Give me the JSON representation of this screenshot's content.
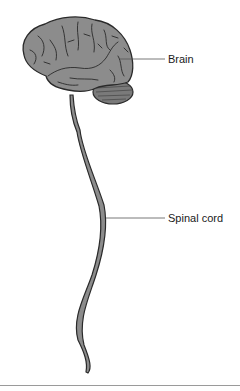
{
  "figure": {
    "type": "anatomical-diagram",
    "labels": [
      {
        "id": "brain",
        "text": "Brain",
        "line_y": 59,
        "line_x1": 120,
        "line_x2": 165
      },
      {
        "id": "spinal_cord",
        "text": "Spinal cord",
        "line_y": 218,
        "line_x1": 106,
        "line_x2": 165
      }
    ],
    "colors": {
      "tissue_fill": "#8c8c8c",
      "outline": "#2a2a2a",
      "leader_line": "#555555",
      "rule": "#9a9a9a"
    }
  }
}
